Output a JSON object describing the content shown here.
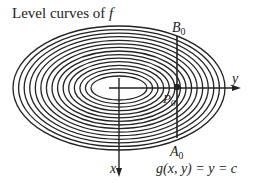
{
  "title": {
    "prefix": "Level curves of ",
    "func": "f"
  },
  "labels": {
    "B": "B",
    "B_sub": "0",
    "P": "P",
    "P_sub": "0",
    "A": "A",
    "A_sub": "0",
    "y_axis": "y",
    "x_axis": "x",
    "equation": "g(x, y) = y = c"
  },
  "geometry": {
    "center": [
      119,
      88
    ],
    "outer_rx": 106,
    "outer_ry": 62,
    "inner_rx": 28,
    "inner_ry": 12,
    "count": 15,
    "line_x": 177,
    "point": [
      177,
      87
    ]
  },
  "colors": {
    "stroke": "#222222",
    "background": "#ffffff"
  }
}
